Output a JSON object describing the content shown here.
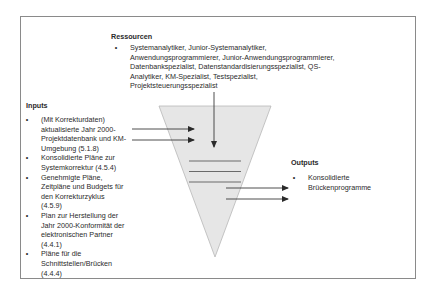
{
  "resources": {
    "heading": "Ressourcen",
    "items": [
      {
        "bullet": "•",
        "lines": [
          "Systemanalytiker, Junior-Systemanalytiker,",
          "Anwendungsprogrammierer, Junior-Anwendungsprogrammierer,",
          "Datenbankspezialist, Datenstandardisierungsspezialist, QS-",
          "Analytiker, KM-Spezialist, Testspezialist,",
          "Projektsteuerungsspezialist"
        ]
      }
    ]
  },
  "inputs": {
    "heading": "Inputs",
    "items": [
      {
        "bullet": "•",
        "lines": [
          "(Mit Korrekturdaten)",
          "aktualisierte Jahr 2000-",
          "Projektdatenbank und KM-",
          "Umgebung (5.1.8)"
        ]
      },
      {
        "bullet": "•",
        "lines": [
          "Konsolidierte Pläne zur",
          "Systemkorrektur (4.5.4)"
        ]
      },
      {
        "bullet": "•",
        "lines": [
          "Genehmigte Pläne,",
          "Zeitpläne und Budgets für",
          "den Korrekturzyklus",
          "(4.5.9)"
        ]
      },
      {
        "bullet": "•",
        "lines": [
          "Plan zur Herstellung der",
          "Jahr 2000-Konformität der",
          "elektronischen Partner",
          "(4.4.1)"
        ]
      },
      {
        "bullet": "•",
        "lines": [
          "Pläne für die",
          "Schnittstellen/Brücken",
          "(4.4.4)"
        ]
      }
    ]
  },
  "outputs": {
    "heading": "Outputs",
    "items": [
      {
        "bullet": "•",
        "lines": [
          "Konsolidierte",
          "Brückenprogramme"
        ]
      }
    ]
  },
  "colors": {
    "funnel_fill": "#e6e6e6",
    "funnel_stroke": "#b0b0b0",
    "arrow": "#3a3a3a",
    "process_lines": "#666666",
    "frame": "#8a8a8a"
  }
}
